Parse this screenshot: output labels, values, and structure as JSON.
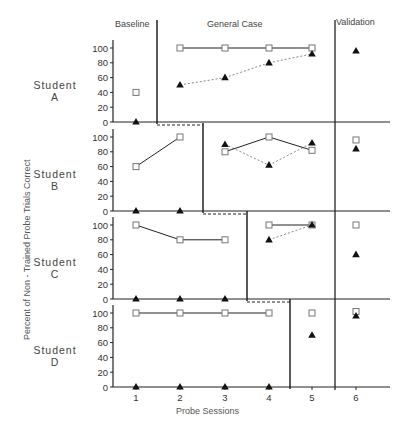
{
  "chart_data": {
    "type": "scatter",
    "title": "",
    "xlabel": "Probe Sessions",
    "ylabel": "Percent of Non - Trained Probe Trials Correct",
    "phases": [
      "Baseline",
      "General Case",
      "Validation"
    ],
    "x_ticks": [
      "1",
      "2",
      "3",
      "4",
      "5",
      "6"
    ],
    "y_ticks": [
      "0",
      "20",
      "40",
      "60",
      "80",
      "100"
    ],
    "ylim": [
      0,
      100
    ],
    "legend": [
      {
        "marker": "open-square",
        "line": "solid"
      },
      {
        "marker": "filled-triangle",
        "line": "dotted"
      }
    ],
    "panels": [
      {
        "student": "Student",
        "letter": "A",
        "baseline_sessions": [
          1
        ],
        "general_case_sessions": [
          2,
          3,
          4,
          5
        ],
        "validation_session": 6,
        "series": [
          {
            "name": "squares",
            "x": [
              1,
              2,
              3,
              4,
              5
            ],
            "values": [
              40,
              100,
              100,
              100,
              100
            ]
          },
          {
            "name": "triangles",
            "x": [
              1,
              2,
              3,
              4,
              5,
              6
            ],
            "values": [
              0,
              50,
              60,
              80,
              92,
              96
            ]
          }
        ]
      },
      {
        "student": "Student",
        "letter": "B",
        "baseline_sessions": [
          1,
          2
        ],
        "general_case_sessions": [
          3,
          4,
          5
        ],
        "validation_session": 6,
        "series": [
          {
            "name": "squares",
            "x": [
              1,
              2,
              3,
              4,
              5,
              6
            ],
            "values": [
              60,
              100,
              80,
              100,
              82,
              96
            ]
          },
          {
            "name": "triangles",
            "x": [
              1,
              2,
              3,
              4,
              5,
              6
            ],
            "values": [
              0,
              0,
              90,
              62,
              92,
              84
            ]
          }
        ]
      },
      {
        "student": "Student",
        "letter": "C",
        "baseline_sessions": [
          1,
          2,
          3
        ],
        "general_case_sessions": [
          4,
          5
        ],
        "validation_session": 6,
        "series": [
          {
            "name": "squares",
            "x": [
              1,
              2,
              3,
              4,
              5,
              6
            ],
            "values": [
              100,
              80,
              80,
              100,
              100,
              100
            ]
          },
          {
            "name": "triangles",
            "x": [
              1,
              2,
              3,
              4,
              5,
              6
            ],
            "values": [
              0,
              0,
              0,
              80,
              100,
              60
            ]
          }
        ]
      },
      {
        "student": "Student",
        "letter": "D",
        "baseline_sessions": [
          1,
          2,
          3,
          4
        ],
        "general_case_sessions": [
          5
        ],
        "validation_session": 6,
        "series": [
          {
            "name": "squares",
            "x": [
              1,
              2,
              3,
              4,
              5,
              6
            ],
            "values": [
              100,
              100,
              100,
              100,
              100,
              102
            ]
          },
          {
            "name": "triangles",
            "x": [
              1,
              2,
              3,
              4,
              5,
              6
            ],
            "values": [
              0,
              0,
              0,
              0,
              70,
              96
            ]
          }
        ]
      }
    ]
  },
  "labels": {
    "phase_baseline": "Baseline",
    "phase_general": "General Case",
    "phase_validation": "Validation",
    "x_axis_title": "Probe Sessions",
    "y_axis_title": "Percent of Non - Trained Probe Trials Correct"
  },
  "colors": {
    "line": "#222222",
    "dotted": "#888888",
    "marker_fill": "#111111",
    "square_stroke": "#777777"
  }
}
